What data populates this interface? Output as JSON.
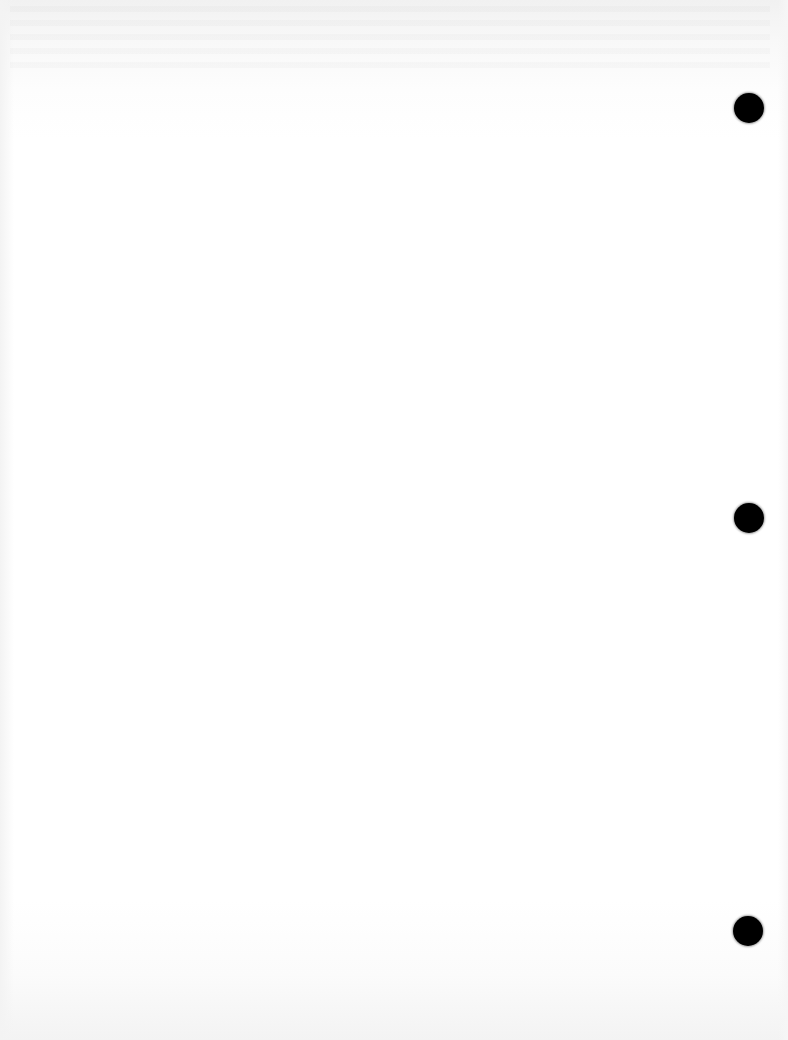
{
  "document": {
    "type": "blank-scanned-page",
    "background_color": "#ffffff",
    "text_content": ""
  },
  "punch_holes": [
    {
      "cx": 749,
      "cy": 108,
      "diameter": 30,
      "color": "#000000"
    },
    {
      "cx": 749,
      "cy": 518,
      "diameter": 30,
      "color": "#000000"
    },
    {
      "cx": 748,
      "cy": 931,
      "diameter": 30,
      "color": "#000000"
    }
  ]
}
